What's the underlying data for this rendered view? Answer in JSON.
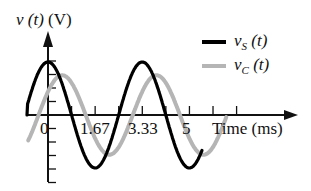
{
  "chart_data": {
    "type": "line",
    "title": "",
    "ylabel": "v (t) (V)",
    "xlabel": "Time (ms)",
    "x_ticks": [
      "0",
      "1.67",
      "3.33",
      "5"
    ],
    "x_tick_values": [
      0,
      1.67,
      3.33,
      5
    ],
    "xlim": [
      -0.75,
      8.75
    ],
    "ylim": [
      -1.2,
      1.0
    ],
    "grid": false,
    "legend_position": "upper right",
    "period_ms": 3.33,
    "series": [
      {
        "name": "v_S (t)",
        "label_main": "v",
        "label_sub": "S",
        "label_tail": " (t)",
        "color": "#000000",
        "amplitude": 1.0,
        "phase_lag_ms": 0,
        "description": "cosine, peak at t=0",
        "x": [
          -0.75,
          0,
          0.83,
          1.67,
          2.5,
          3.33,
          4.17,
          5.0,
          5.4
        ],
        "values": [
          0.0,
          1.0,
          0.0,
          -1.0,
          0.0,
          1.0,
          0.0,
          -1.0,
          -0.55
        ]
      },
      {
        "name": "v_C (t)",
        "label_main": "v",
        "label_sub": "C",
        "label_tail": " (t)",
        "color": "#b5b5b5",
        "amplitude": 0.75,
        "phase_lag_ms": 0.5,
        "description": "lagging cosine, smaller amplitude",
        "x": [
          -0.75,
          0.5,
          1.33,
          2.17,
          3.0,
          3.83,
          4.67,
          5.5,
          6.3
        ],
        "values": [
          -0.75,
          0.75,
          0.0,
          -0.75,
          0.0,
          0.75,
          0.0,
          -0.75,
          0.0
        ]
      }
    ]
  },
  "axes": {
    "ylabel_main": "v",
    "ylabel_arg": "(t)",
    "ylabel_unit": "(V)",
    "xlabel": "Time (ms)"
  }
}
